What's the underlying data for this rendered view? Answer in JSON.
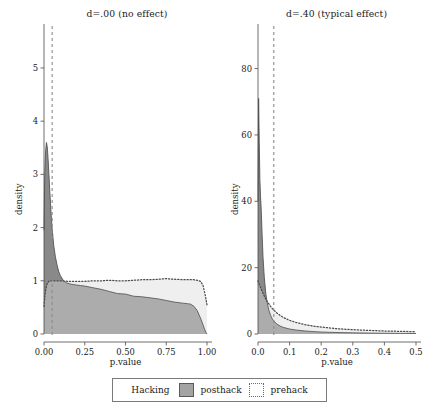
{
  "figure": {
    "legend": {
      "title": "Hacking",
      "items": [
        {
          "label": "posthack",
          "swatch": "filled-gray-square",
          "color": "#a3a3a3"
        },
        {
          "label": "prehack",
          "swatch": "dotted-outline-square",
          "color": "#6a6a6a"
        }
      ]
    }
  },
  "chart_data": [
    {
      "type": "area",
      "panel": "left",
      "title": "d=.00 (no effect)",
      "xlabel": "p.value",
      "ylabel": "density",
      "xlim": [
        0,
        1
      ],
      "ylim": [
        0,
        5.3
      ],
      "xticks": [
        0.0,
        0.25,
        0.5,
        0.75,
        1.0
      ],
      "xticklabels": [
        "0.00",
        "0.25",
        "0.50",
        "0.75",
        "1.00"
      ],
      "yticks": [
        0,
        1,
        2,
        3,
        4,
        5
      ],
      "yticklabels": [
        "0",
        "1",
        "2",
        "3",
        "4",
        "5"
      ],
      "grid": false,
      "legend_position": "bottom",
      "annotations": [
        {
          "type": "vline",
          "x": 0.05,
          "style": "dashed",
          "color": "#8a8a8a",
          "label": "alpha = .05"
        }
      ],
      "series": [
        {
          "name": "posthack",
          "style": "filled-area",
          "color": "#a3a3a3",
          "x": [
            0.0,
            0.005,
            0.01,
            0.015,
            0.02,
            0.025,
            0.03,
            0.035,
            0.04,
            0.045,
            0.05,
            0.06,
            0.07,
            0.08,
            0.09,
            0.1,
            0.12,
            0.14,
            0.16,
            0.18,
            0.2,
            0.225,
            0.25,
            0.3,
            0.35,
            0.4,
            0.45,
            0.5,
            0.55,
            0.6,
            0.65,
            0.7,
            0.75,
            0.8,
            0.85,
            0.88,
            0.9,
            0.92,
            0.94,
            0.96,
            0.975,
            0.985,
            0.995,
            1.0
          ],
          "values": [
            1.95,
            3.05,
            3.45,
            3.6,
            3.52,
            3.3,
            3.02,
            2.72,
            2.45,
            2.2,
            1.98,
            1.66,
            1.45,
            1.3,
            1.18,
            1.1,
            1.0,
            0.96,
            0.94,
            0.93,
            0.92,
            0.91,
            0.9,
            0.87,
            0.84,
            0.8,
            0.76,
            0.75,
            0.71,
            0.7,
            0.68,
            0.66,
            0.63,
            0.6,
            0.58,
            0.57,
            0.56,
            0.52,
            0.44,
            0.3,
            0.18,
            0.09,
            0.02,
            0.0
          ]
        },
        {
          "name": "prehack",
          "style": "dotted-line",
          "color": "#555555",
          "x": [
            0.0,
            0.005,
            0.01,
            0.015,
            0.02,
            0.025,
            0.03,
            0.035,
            0.04,
            0.05,
            0.06,
            0.08,
            0.1,
            0.15,
            0.2,
            0.25,
            0.3,
            0.35,
            0.4,
            0.45,
            0.5,
            0.55,
            0.6,
            0.65,
            0.7,
            0.75,
            0.8,
            0.85,
            0.88,
            0.9,
            0.92,
            0.94,
            0.96,
            0.975,
            0.99,
            1.0
          ],
          "values": [
            0.52,
            0.7,
            0.82,
            0.9,
            0.95,
            0.97,
            0.99,
            1.0,
            1.0,
            1.0,
            1.0,
            1.0,
            1.0,
            0.99,
            0.99,
            0.99,
            1.0,
            1.0,
            1.01,
            1.0,
            1.0,
            1.01,
            1.02,
            1.02,
            1.03,
            1.04,
            1.03,
            1.02,
            1.02,
            1.02,
            1.02,
            1.01,
            0.99,
            0.92,
            0.72,
            0.55
          ]
        }
      ]
    },
    {
      "type": "area",
      "panel": "right",
      "title": "d=.40 (typical effect)",
      "xlabel": "p.value",
      "ylabel": "density",
      "xlim": [
        0,
        0.5
      ],
      "ylim": [
        0,
        85
      ],
      "xticks": [
        0.0,
        0.1,
        0.2,
        0.3,
        0.4,
        0.5
      ],
      "xticklabels": [
        "0.0",
        "0.1",
        "0.2",
        "0.3",
        "0.4",
        "0.5"
      ],
      "yticks": [
        0,
        20,
        40,
        60,
        80
      ],
      "yticklabels": [
        "0",
        "20",
        "40",
        "60",
        "80"
      ],
      "grid": false,
      "legend_position": "bottom",
      "annotations": [
        {
          "type": "vline",
          "x": 0.05,
          "style": "dashed",
          "color": "#8a8a8a",
          "label": "alpha = .05"
        }
      ],
      "series": [
        {
          "name": "posthack",
          "style": "filled-area",
          "color": "#a3a3a3",
          "x": [
            0.0,
            0.002,
            0.004,
            0.006,
            0.008,
            0.01,
            0.013,
            0.016,
            0.02,
            0.025,
            0.03,
            0.035,
            0.04,
            0.045,
            0.05,
            0.06,
            0.07,
            0.08,
            0.1,
            0.12,
            0.15,
            0.18,
            0.2,
            0.25,
            0.3,
            0.35,
            0.4,
            0.45,
            0.5
          ],
          "values": [
            40.0,
            71.0,
            58.0,
            46.5,
            41.5,
            38.0,
            30.0,
            23.0,
            17.0,
            12.0,
            9.0,
            7.0,
            5.6,
            4.6,
            3.9,
            3.0,
            2.4,
            2.0,
            1.5,
            1.2,
            0.9,
            0.7,
            0.6,
            0.45,
            0.35,
            0.28,
            0.22,
            0.18,
            0.15
          ]
        },
        {
          "name": "prehack",
          "style": "dotted-line",
          "color": "#555555",
          "x": [
            0.0,
            0.003,
            0.006,
            0.01,
            0.014,
            0.018,
            0.022,
            0.026,
            0.03,
            0.035,
            0.04,
            0.045,
            0.05,
            0.06,
            0.07,
            0.08,
            0.1,
            0.12,
            0.15,
            0.18,
            0.2,
            0.25,
            0.3,
            0.35,
            0.4,
            0.45,
            0.5
          ],
          "values": [
            16.0,
            15.2,
            14.5,
            13.5,
            12.6,
            11.8,
            11.0,
            10.3,
            9.7,
            9.0,
            8.3,
            7.7,
            7.2,
            6.3,
            5.6,
            5.0,
            4.1,
            3.5,
            2.8,
            2.3,
            2.1,
            1.6,
            1.3,
            1.1,
            0.9,
            0.8,
            0.7
          ]
        }
      ]
    }
  ]
}
